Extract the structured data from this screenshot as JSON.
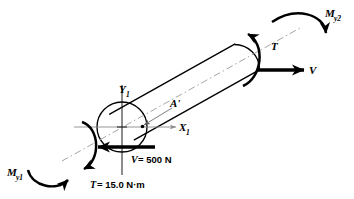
{
  "figure": {
    "background_color": "#ffffff",
    "line_color": "#000000",
    "axis_color": "#8a8a8a"
  },
  "labels": {
    "moment_near": {
      "symbol": "M",
      "subscript": "y1",
      "name": "M_y1"
    },
    "moment_far": {
      "symbol": "M",
      "subscript": "y2",
      "name": "M_y2"
    },
    "torque_far": {
      "symbol": "T",
      "name": "T"
    },
    "shear_far": {
      "symbol": "V",
      "name": "V"
    },
    "point_a": {
      "symbol": "A'",
      "name": "A-prime"
    },
    "axis_y": {
      "symbol": "Y",
      "subscript": "1",
      "name": "Y1-axis"
    },
    "axis_x": {
      "symbol": "X",
      "subscript": "1",
      "name": "X1-axis"
    }
  },
  "values": {
    "shear_value": {
      "symbol": "V",
      "equals": "= 500 N",
      "full": "V = 500 N"
    },
    "torque_value": {
      "symbol": "T",
      "equals": "= 15.0 N·m",
      "full": "T = 15.0 N·m"
    }
  },
  "geometry": {
    "rod_angle_deg": -30,
    "near_end_center": [
      122,
      127
    ],
    "near_end_radius": 25,
    "far_end_center": [
      247,
      57
    ]
  }
}
